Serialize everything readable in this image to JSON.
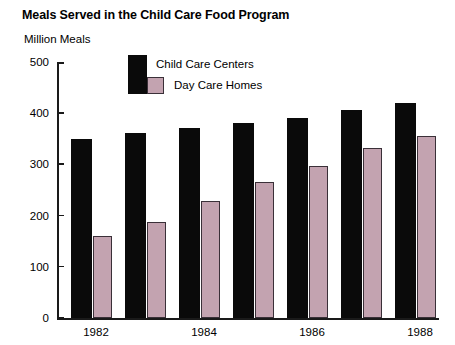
{
  "chart_data": {
    "type": "bar",
    "title": "Meals Served in the Child Care Food Program",
    "ylabel": "Million Meals",
    "xlabel": "",
    "ylim": [
      0,
      500
    ],
    "yticks": [
      0,
      100,
      200,
      300,
      400,
      500
    ],
    "ytick_labels": [
      "0",
      "100",
      "200",
      "300",
      "400",
      "500"
    ],
    "grid": false,
    "legend_position": "upper-center-inside",
    "categories": [
      "1982",
      "1983",
      "1984",
      "1985",
      "1986",
      "1987",
      "1988"
    ],
    "xtick_labels_shown": [
      "1982",
      "1984",
      "1986",
      "1988"
    ],
    "series": [
      {
        "name": "Child Care Centers",
        "color": "#0a0a0a",
        "values": [
          350,
          361,
          372,
          381,
          391,
          406,
          420
        ]
      },
      {
        "name": "Day Care Homes",
        "color": "#c3a3b0",
        "values": [
          160,
          187,
          228,
          265,
          297,
          332,
          356
        ]
      }
    ]
  },
  "axes": {
    "tick_0": "0",
    "tick_100": "100",
    "tick_200": "200",
    "tick_300": "300",
    "tick_400": "400",
    "tick_500": "500",
    "x_1982": "1982",
    "x_1984": "1984",
    "x_1986": "1986",
    "x_1988": "1988"
  },
  "legend": {
    "entry_centers": "Child Care Centers",
    "entry_homes": "Day Care Homes"
  }
}
